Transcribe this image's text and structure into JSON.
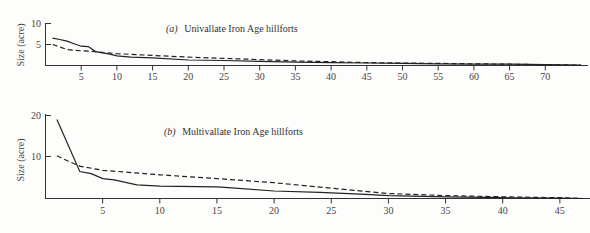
{
  "chart_data": [
    {
      "type": "line",
      "panel": "a",
      "title": "(a) Univallate Iron Age hillforts",
      "xlabel": "",
      "ylabel": "Size (acre)",
      "xlim": [
        0,
        75
      ],
      "ylim": [
        0,
        10
      ],
      "xticks": [
        5,
        10,
        15,
        20,
        25,
        30,
        35,
        40,
        45,
        50,
        55,
        60,
        65,
        70
      ],
      "yticks": [
        5,
        10
      ],
      "grid": false,
      "series": [
        {
          "name": "observed",
          "style": "solid",
          "x": [
            1,
            2,
            3,
            4,
            5,
            6,
            7,
            8,
            9,
            10,
            12,
            15,
            20,
            25,
            30,
            35,
            40,
            45,
            50,
            55,
            60,
            65,
            70,
            75
          ],
          "values": [
            6.5,
            6.2,
            5.8,
            5.2,
            4.6,
            4.5,
            3.3,
            3.0,
            2.7,
            2.3,
            2.0,
            1.8,
            1.3,
            1.2,
            1.0,
            0.8,
            0.7,
            0.6,
            0.5,
            0.4,
            0.3,
            0.3,
            0.2,
            0.1
          ]
        },
        {
          "name": "expected",
          "style": "dashed",
          "x": [
            1,
            2,
            3,
            5,
            7,
            10,
            15,
            20,
            25,
            30,
            35,
            40,
            45,
            50,
            55,
            60,
            65,
            70,
            75
          ],
          "values": [
            5.0,
            4.4,
            3.8,
            3.5,
            3.3,
            2.8,
            2.4,
            2.0,
            1.7,
            1.4,
            1.1,
            0.9,
            0.7,
            0.6,
            0.5,
            0.4,
            0.3,
            0.2,
            0.1
          ]
        }
      ]
    },
    {
      "type": "line",
      "panel": "b",
      "title": "(b) Multivallate Iron Age hillforts",
      "xlabel": "",
      "ylabel": "Size (acre)",
      "xlim": [
        0,
        47
      ],
      "ylim": [
        0,
        20
      ],
      "xticks": [
        5,
        10,
        15,
        20,
        25,
        30,
        35,
        40,
        45
      ],
      "yticks": [
        10,
        20
      ],
      "grid": false,
      "series": [
        {
          "name": "observed",
          "style": "solid",
          "x": [
            1,
            3,
            4,
            5,
            6,
            8,
            10,
            15,
            16,
            20,
            24,
            28,
            30,
            35,
            40,
            45,
            47
          ],
          "values": [
            19,
            6.5,
            6.0,
            4.8,
            4.5,
            3.3,
            3.0,
            2.8,
            2.6,
            1.8,
            1.5,
            1.0,
            0.7,
            0.4,
            0.2,
            0.1,
            0.0
          ]
        },
        {
          "name": "expected",
          "style": "dashed",
          "x": [
            1,
            2,
            3,
            5,
            10,
            15,
            20,
            25,
            30,
            35,
            40,
            45,
            47
          ],
          "values": [
            10.3,
            9.0,
            7.8,
            6.8,
            5.7,
            4.8,
            3.8,
            2.5,
            1.2,
            0.7,
            0.4,
            0.2,
            0.0
          ]
        }
      ]
    }
  ],
  "panels": {
    "a": {
      "title_prefix": "(a)",
      "title_text": "Univallate Iron Age hillforts",
      "ylabel": "Size (acre)",
      "ytick_labels": [
        "5",
        "10"
      ],
      "xtick_labels": [
        "5",
        "10",
        "15",
        "20",
        "25",
        "30",
        "35",
        "40",
        "45",
        "50",
        "55",
        "60",
        "65",
        "70"
      ]
    },
    "b": {
      "title_prefix": "(b)",
      "title_text": "Multivallate Iron Age hillforts",
      "ylabel": "Size (acre)",
      "ytick_labels": [
        "10",
        "20"
      ],
      "xtick_labels": [
        "5",
        "10",
        "15",
        "20",
        "25",
        "30",
        "35",
        "40",
        "45"
      ]
    }
  }
}
